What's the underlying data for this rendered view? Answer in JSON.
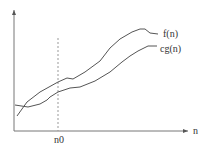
{
  "chart_data": {
    "type": "line",
    "title": "",
    "xlabel": "n",
    "ylabel": "",
    "grid": false,
    "annotations": [
      {
        "type": "vertical-dashed-line",
        "label": "n0",
        "x_px": 58
      }
    ],
    "series": [
      {
        "name": "f(n)",
        "label_pos": [
          160,
          37
        ],
        "points": [
          [
            17,
            116
          ],
          [
            27,
            102
          ],
          [
            40,
            92
          ],
          [
            58,
            82
          ],
          [
            67,
            78
          ],
          [
            73,
            79
          ],
          [
            85,
            72
          ],
          [
            100,
            61
          ],
          [
            110,
            48
          ],
          [
            120,
            39
          ],
          [
            132,
            32
          ],
          [
            140,
            29
          ],
          [
            145,
            29
          ],
          [
            150,
            33
          ],
          [
            158,
            34
          ]
        ]
      },
      {
        "name": "cg(n)",
        "label_pos": [
          160,
          52
        ],
        "points": [
          [
            15,
            105
          ],
          [
            28,
            107
          ],
          [
            40,
            104
          ],
          [
            47,
            100
          ],
          [
            50,
            97
          ],
          [
            58,
            92
          ],
          [
            70,
            88
          ],
          [
            80,
            87
          ],
          [
            95,
            81
          ],
          [
            110,
            72
          ],
          [
            122,
            62
          ],
          [
            130,
            56
          ],
          [
            138,
            51
          ],
          [
            148,
            46
          ],
          [
            157,
            46
          ]
        ]
      }
    ]
  },
  "labels": {
    "x_axis": "n",
    "threshold": "n0",
    "f": "f(n)",
    "cg": "cg(n)"
  }
}
